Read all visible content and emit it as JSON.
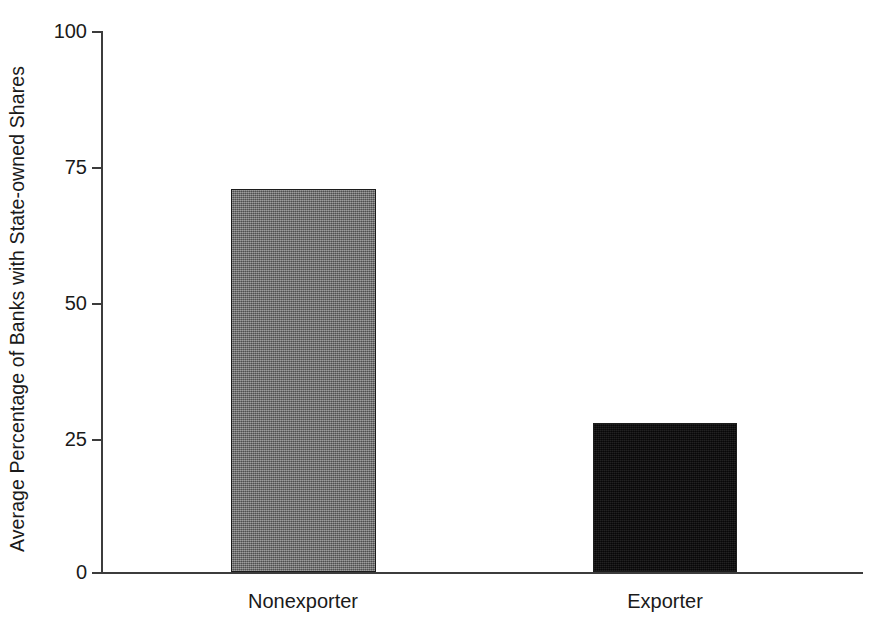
{
  "chart_data": {
    "type": "bar",
    "title": "",
    "xlabel": "",
    "ylabel": "Average Percentage of Banks with State-owned Shares",
    "categories": [
      "Nonexporter",
      "Exporter"
    ],
    "values": [
      70.8,
      27.6
    ],
    "ylim": [
      0,
      100
    ],
    "yticks": [
      0,
      25,
      50,
      75,
      100
    ],
    "ytick_labels": [
      "0",
      "25",
      "50",
      "75",
      "100"
    ],
    "grid": false,
    "legend": "none",
    "series": [
      {
        "name": "Average Percentage of Banks with State-owned Shares",
        "values": [
          70.8,
          27.6
        ]
      }
    ],
    "bar_styles": [
      {
        "category": "Nonexporter",
        "fill": "#6e6e6e",
        "pattern": "dithered-gray",
        "edge": "#1c1c1c"
      },
      {
        "category": "Exporter",
        "fill": "#100f10",
        "pattern": "solid-black",
        "edge": "#1c1c1c"
      }
    ],
    "axis_color": "#3c3c3c",
    "background": "#ffffff"
  },
  "axis": {
    "y_label": "Average Percentage of Banks with State-owned Shares",
    "y_tick_labels": [
      "100",
      "75",
      "50",
      "25",
      "0"
    ],
    "x_tick_labels": [
      "Nonexporter",
      "Exporter"
    ]
  }
}
